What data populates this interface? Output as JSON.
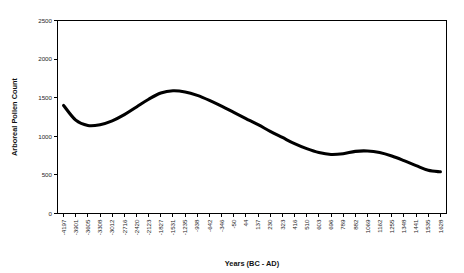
{
  "chart_data": {
    "type": "line",
    "title": "",
    "xlabel": "Years (BC - AD)",
    "ylabel": "Arboreal Pollen Count",
    "grid": false,
    "legend": "none",
    "ylim": [
      0,
      2500
    ],
    "ytick_labels": [
      "0",
      "500",
      "1000",
      "1500",
      "2000",
      "2500"
    ],
    "ytick_values": [
      0,
      500,
      1000,
      1500,
      2000,
      2500
    ],
    "categories": [
      "-4197",
      "-3901",
      "-3605",
      "-3308",
      "-3012",
      "-2716",
      "-2420",
      "-2123",
      "-1827",
      "-1531",
      "-1235",
      "-938",
      "-642",
      "-346",
      "-50",
      "44",
      "137",
      "230",
      "323",
      "416",
      "510",
      "603",
      "696",
      "789",
      "882",
      "1069",
      "1162",
      "1255",
      "1348",
      "1441",
      "1535",
      "1628"
    ],
    "series": [
      {
        "name": "Arboreal Pollen Count",
        "values": [
          1400,
          1210,
          1140,
          1150,
          1200,
          1280,
          1380,
          1480,
          1560,
          1590,
          1575,
          1530,
          1465,
          1390,
          1310,
          1230,
          1150,
          1065,
          985,
          905,
          840,
          790,
          765,
          775,
          805,
          810,
          790,
          745,
          685,
          620,
          560,
          540
        ]
      }
    ],
    "colors": {
      "line": "#000000",
      "axis": "#000000",
      "background": "#ffffff",
      "tick_text": "#262626"
    }
  }
}
